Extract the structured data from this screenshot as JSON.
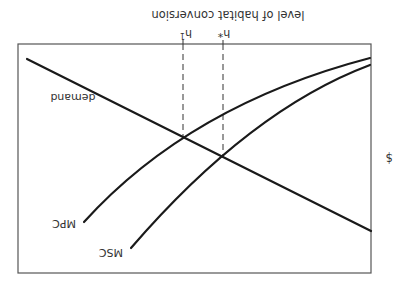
{
  "figure": {
    "orientation": "rotated 180 degrees",
    "x_axis_label": "level of habitat conversion",
    "y_axis_label": "$",
    "curves": {
      "demand": "demand",
      "mpc": "MPC",
      "msc": "MSC"
    },
    "markers": {
      "h1": "h",
      "h1_sub": "1",
      "hstar": "h*"
    }
  },
  "colors": {
    "line": "#1a1a1a",
    "frame": "#555555",
    "text": "#333333",
    "background": "#ffffff"
  }
}
